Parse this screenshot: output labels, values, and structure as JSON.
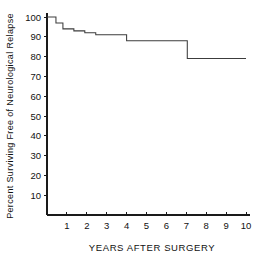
{
  "chart_data": {
    "type": "line",
    "title": "",
    "subtitle": "",
    "xlabel": "YEARS AFTER SURGERY",
    "ylabel": "Percent Surviving Free of Neurological Relapse",
    "xlim": [
      0,
      10
    ],
    "ylim": [
      0,
      100
    ],
    "grid": false,
    "legend": "none",
    "style": "kaplan-meier step function",
    "x_ticks": [
      1,
      2,
      3,
      4,
      5,
      6,
      7,
      8,
      9,
      10
    ],
    "x_tick_labels": [
      "1",
      "2",
      "3",
      "4",
      "5",
      "6",
      "7",
      "8",
      "9",
      "10"
    ],
    "y_ticks": [
      10,
      20,
      30,
      40,
      50,
      60,
      70,
      80,
      90,
      100
    ],
    "y_tick_labels": [
      "10",
      "20",
      "30",
      "40",
      "50",
      "60",
      "70",
      "80",
      "90",
      "100"
    ],
    "series": [
      {
        "name": "Percent surviving free of neurological relapse",
        "step": "post",
        "x": [
          0.0,
          0.25,
          0.45,
          0.8,
          1.35,
          1.9,
          2.45,
          4.0,
          7.05,
          10.0
        ],
        "values": [
          100,
          100,
          97,
          94,
          93,
          92,
          91,
          88,
          79,
          79
        ],
        "points": [
          {
            "x": 0.0,
            "y": 100
          },
          {
            "x": 0.25,
            "y": 100
          },
          {
            "x": 0.45,
            "y": 97
          },
          {
            "x": 0.8,
            "y": 94
          },
          {
            "x": 1.35,
            "y": 93
          },
          {
            "x": 1.9,
            "y": 92
          },
          {
            "x": 2.45,
            "y": 91
          },
          {
            "x": 4.0,
            "y": 88
          },
          {
            "x": 7.05,
            "y": 79
          },
          {
            "x": 10.0,
            "y": 79
          }
        ]
      }
    ],
    "annotations": []
  },
  "axes": {
    "y_title": "Percent Surviving Free of Neurological Relapse",
    "x_title": "YEARS AFTER SURGERY"
  },
  "colors": {
    "background": "#ffffff",
    "axis": "#1a1a1a",
    "curve": "#3c3c3c",
    "text": "#111111"
  }
}
